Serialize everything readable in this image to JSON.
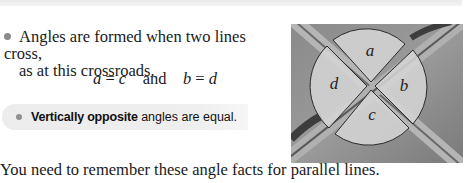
{
  "bullet": {
    "line1": "Angles are formed when two lines cross,",
    "line2": "as at this crossroads."
  },
  "equation": {
    "lhs1": "a",
    "eq1": " = ",
    "rhs1": "c",
    "connector": "and",
    "lhs2": "b",
    "eq2": " = ",
    "rhs2": "d"
  },
  "rule": {
    "bold": "Vertically opposite",
    "rest": " angles are equal."
  },
  "footer": "You need to remember these angle facts for parallel lines.",
  "figure": {
    "labels": {
      "a": "a",
      "b": "b",
      "c": "c",
      "d": "d"
    }
  }
}
